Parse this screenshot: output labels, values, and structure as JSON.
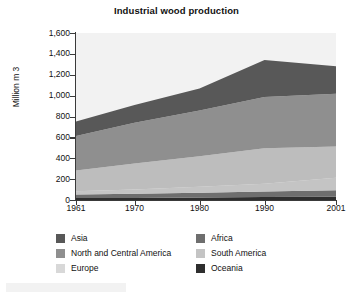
{
  "chart_data": {
    "type": "area",
    "stacked": true,
    "title": "Industrial wood production",
    "xlabel": "",
    "ylabel": "Million m 3",
    "ylim": [
      0,
      1600
    ],
    "xlim": [
      1961,
      2001
    ],
    "yticks": [
      "0",
      "200",
      "400",
      "600",
      "800",
      "1,000",
      "1,200",
      "1,400",
      "1,600"
    ],
    "ytick_values": [
      0,
      200,
      400,
      600,
      800,
      1000,
      1200,
      1400,
      1600
    ],
    "xticks": [
      "1961",
      "1970",
      "1980",
      "1990",
      "2001"
    ],
    "xtick_values": [
      1961,
      1970,
      1980,
      1990,
      2001
    ],
    "grid": false,
    "legend_position": "bottom",
    "x": [
      1961,
      1970,
      1980,
      1990,
      2001
    ],
    "series": [
      {
        "name": "Oceania",
        "color": "#2e2e2e",
        "values": [
          18,
          20,
          24,
          28,
          32
        ]
      },
      {
        "name": "Africa",
        "color": "#6e6e6e",
        "values": [
          35,
          40,
          46,
          54,
          62
        ]
      },
      {
        "name": "South America",
        "color": "#c4c4c4",
        "values": [
          30,
          40,
          58,
          74,
          118
        ]
      },
      {
        "name": "Europe",
        "color": "#bdbdbd",
        "values": [
          200,
          250,
          290,
          340,
          300
        ]
      },
      {
        "name": "North and Central America",
        "color": "#8f8f8f",
        "values": [
          330,
          390,
          440,
          490,
          505
        ]
      },
      {
        "name": "Asia",
        "color": "#585858",
        "values": [
          140,
          170,
          210,
          355,
          265
        ]
      }
    ],
    "totals": [
      753,
      910,
      1068,
      1341,
      1282
    ],
    "annotations": []
  },
  "legend": {
    "items": [
      {
        "label": "Asia",
        "color": "#585858"
      },
      {
        "label": "Africa",
        "color": "#6e6e6e"
      },
      {
        "label": "North and Central America",
        "color": "#8f8f8f"
      },
      {
        "label": "South America",
        "color": "#c4c4c4"
      },
      {
        "label": "Europe",
        "color": "#d8d8d8"
      },
      {
        "label": "Oceania",
        "color": "#2e2e2e"
      }
    ]
  },
  "style": {
    "plot_background": "#f2f2f2",
    "axis_color": "#3a3a3a",
    "text_color": "#111111",
    "top_fill": "#f2f2f2"
  }
}
